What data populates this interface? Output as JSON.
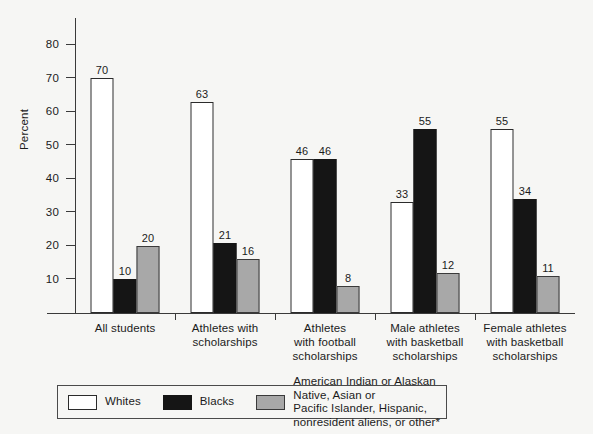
{
  "chart_data": {
    "type": "bar",
    "title": "",
    "xlabel": "",
    "ylabel": "Percent",
    "ylim": [
      0,
      88
    ],
    "ytick_values": [
      10,
      20,
      30,
      40,
      50,
      60,
      70,
      80
    ],
    "ytick_labels": [
      "10",
      "20",
      "30",
      "40",
      "50",
      "60",
      "70",
      "80"
    ],
    "grid": false,
    "legend_position": "bottom",
    "categories": [
      "All students",
      "Athletes with scholarships",
      "Athletes with football scholarships",
      "Male athletes with basketball scholarships",
      "Female athletes with basketball scholarships"
    ],
    "category_label_lines": [
      [
        "All students"
      ],
      [
        "Athletes with",
        "scholarships"
      ],
      [
        "Athletes",
        "with football",
        "scholarships"
      ],
      [
        "Male athletes",
        "with basketball",
        "scholarships"
      ],
      [
        "Female athletes",
        "with basketball",
        "scholarships"
      ]
    ],
    "series": [
      {
        "name": "Whites",
        "color": "#ffffff",
        "values": [
          70,
          63,
          46,
          33,
          55
        ]
      },
      {
        "name": "Blacks",
        "color": "#151515",
        "values": [
          10,
          21,
          46,
          55,
          34
        ]
      },
      {
        "name": "American Indian or Alaskan Native, Asian or Pacific Islander, Hispanic, nonresident aliens, or other*",
        "color": "#a8a8a8",
        "values": [
          20,
          16,
          8,
          12,
          11
        ]
      }
    ]
  },
  "legend": {
    "entries": [
      {
        "label": "Whites",
        "swatch": "whites"
      },
      {
        "label": "Blacks",
        "swatch": "blacks"
      },
      {
        "label": "American Indian or Alaskan Native, Asian or\nPacific Islander, Hispanic, nonresident aliens, or other*",
        "swatch": "other"
      }
    ]
  }
}
